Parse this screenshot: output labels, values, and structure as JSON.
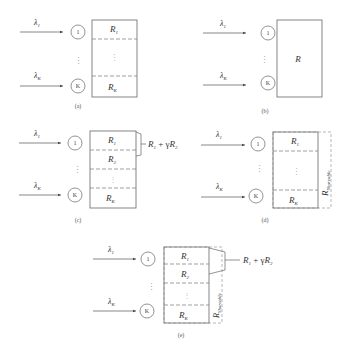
{
  "figure": {
    "panels": [
      {
        "id": "a",
        "caption": "(a)",
        "inputs": [
          {
            "label": "λ",
            "sub": "1",
            "node": "1"
          },
          {
            "label": "λ",
            "sub": "K",
            "node": "K"
          }
        ],
        "segments": [
          {
            "label": "R",
            "sub": "1"
          },
          {
            "label": "R",
            "sub": "K"
          }
        ]
      },
      {
        "id": "b",
        "caption": "(b)",
        "inputs": [
          {
            "label": "λ",
            "sub": "1",
            "node": "1"
          },
          {
            "label": "λ",
            "sub": "K",
            "node": "K"
          }
        ],
        "block_label": "R"
      },
      {
        "id": "c",
        "caption": "(c)",
        "inputs": [
          {
            "label": "λ",
            "sub": "1",
            "node": "1"
          },
          {
            "label": "λ",
            "sub": "K",
            "node": "K"
          }
        ],
        "segments": [
          {
            "label": "R",
            "sub": "1"
          },
          {
            "label": "R",
            "sub": "2"
          },
          {
            "label": "R",
            "sub": "K"
          }
        ],
        "annotation": {
          "a": "R",
          "a_sub": "1",
          "op": " + γ",
          "b": "R",
          "b_sub": "2"
        }
      },
      {
        "id": "d",
        "caption": "(d)",
        "inputs": [
          {
            "label": "λ",
            "sub": "1",
            "node": "1"
          },
          {
            "label": "λ",
            "sub": "K",
            "node": "K"
          }
        ],
        "segments": [
          {
            "label": "R",
            "sub": "1"
          },
          {
            "label": "R",
            "sub": "K"
          }
        ],
        "shared": {
          "label": "R",
          "sub": "Shareable"
        }
      },
      {
        "id": "e",
        "caption": "(e)",
        "inputs": [
          {
            "label": "λ",
            "sub": "1",
            "node": "1"
          },
          {
            "label": "λ",
            "sub": "K",
            "node": "K"
          }
        ],
        "segments": [
          {
            "label": "R",
            "sub": "1"
          },
          {
            "label": "R",
            "sub": "2"
          },
          {
            "label": "R",
            "sub": "K"
          }
        ],
        "shared": {
          "label": "R",
          "sub": "Shareable"
        },
        "annotation": {
          "a": "R",
          "a_sub": "1",
          "op": " + γ",
          "b": "R",
          "b_sub": "2"
        }
      }
    ],
    "dots": "⋮"
  }
}
